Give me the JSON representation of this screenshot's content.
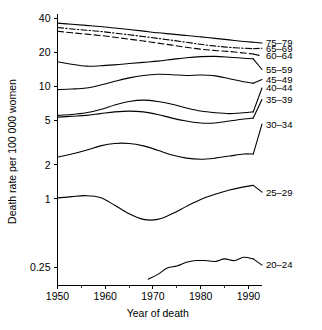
{
  "chart_data": {
    "type": "line",
    "title": "",
    "subtitle": "",
    "xlabel": "Year of death",
    "ylabel": "Death rate per 100 000 women",
    "xlim": [
      1950,
      1992
    ],
    "ylim": [
      0.2,
      45
    ],
    "yscale": "log",
    "xscale": "linear",
    "grid": false,
    "legend_position": "right-inline-labels",
    "x_ticks": [
      1950,
      1960,
      1970,
      1980,
      1990
    ],
    "x_tick_labels": [
      "1950",
      "1960",
      "1970",
      "1980",
      "1990"
    ],
    "x_minor_ticks": [
      1955,
      1965,
      1975,
      1985
    ],
    "y_ticks": [
      0.25,
      1,
      2,
      5,
      10,
      20,
      40
    ],
    "y_tick_labels": [
      "0.25",
      "1",
      "2",
      "5",
      "10",
      "20",
      "40"
    ],
    "series": [
      {
        "name": "75-79",
        "label": "75–79",
        "style": "solid",
        "label_y_value": 24.0,
        "x": [
          1950,
          1953,
          1956,
          1959,
          1962,
          1965,
          1968,
          1971,
          1974,
          1977,
          1980,
          1983,
          1986,
          1989,
          1991
        ],
        "values": [
          36.0,
          35.2,
          34.4,
          33.6,
          32.6,
          31.6,
          30.6,
          29.6,
          28.8,
          28.0,
          27.2,
          26.4,
          25.6,
          24.8,
          24.4
        ]
      },
      {
        "name": "65-69",
        "label": "65–69",
        "style": "dashdot",
        "label_y_value": 21.6,
        "x": [
          1950,
          1953,
          1956,
          1959,
          1962,
          1965,
          1968,
          1971,
          1974,
          1977,
          1980,
          1983,
          1986,
          1989,
          1991
        ],
        "values": [
          33.0,
          32.0,
          31.2,
          30.4,
          29.4,
          28.4,
          27.4,
          26.4,
          25.4,
          24.4,
          23.4,
          22.6,
          22.0,
          21.6,
          21.4
        ]
      },
      {
        "name": "60-64",
        "label": "60–64",
        "style": "dashed",
        "label_y_value": 18.4,
        "x": [
          1950,
          1953,
          1956,
          1959,
          1962,
          1965,
          1968,
          1971,
          1974,
          1977,
          1980,
          1983,
          1986,
          1989,
          1991
        ],
        "values": [
          30.5,
          29.6,
          28.8,
          28.0,
          27.0,
          26.0,
          25.0,
          24.0,
          23.0,
          22.0,
          21.2,
          20.6,
          20.2,
          19.6,
          19.2
        ]
      },
      {
        "name": "55-59",
        "label": "55–59",
        "style": "solid",
        "label_y_value": 14.0,
        "x": [
          1950,
          1953,
          1956,
          1959,
          1962,
          1965,
          1968,
          1971,
          1974,
          1977,
          1980,
          1983,
          1986,
          1989,
          1991
        ],
        "values": [
          16.4,
          15.6,
          15.0,
          15.1,
          15.4,
          15.8,
          16.2,
          16.6,
          17.2,
          17.8,
          18.2,
          18.3,
          18.0,
          17.6,
          17.4
        ]
      },
      {
        "name": "45-49",
        "label": "45–49",
        "style": "solid",
        "label_y_value": 11.4,
        "x": [
          1950,
          1953,
          1956,
          1959,
          1962,
          1965,
          1968,
          1971,
          1974,
          1977,
          1980,
          1983,
          1986,
          1989,
          1991
        ],
        "values": [
          9.3,
          9.4,
          9.6,
          10.2,
          11.0,
          11.8,
          12.4,
          12.7,
          12.6,
          12.4,
          12.5,
          12.3,
          11.6,
          10.9,
          10.6
        ]
      },
      {
        "name": "40-44",
        "label": "40–44",
        "style": "solid",
        "label_y_value": 9.6,
        "x": [
          1950,
          1953,
          1956,
          1959,
          1962,
          1965,
          1968,
          1971,
          1974,
          1977,
          1980,
          1983,
          1986,
          1989,
          1991
        ],
        "values": [
          5.5,
          5.6,
          5.8,
          6.2,
          6.8,
          7.3,
          7.5,
          7.3,
          6.9,
          6.4,
          6.0,
          5.8,
          5.7,
          5.8,
          5.9
        ]
      },
      {
        "name": "35-39",
        "label": "35–39",
        "style": "solid",
        "label_y_value": 7.6,
        "x": [
          1950,
          1953,
          1956,
          1959,
          1962,
          1965,
          1968,
          1971,
          1974,
          1977,
          1980,
          1983,
          1986,
          1989,
          1991
        ],
        "values": [
          5.3,
          5.4,
          5.5,
          5.7,
          5.9,
          6.0,
          5.9,
          5.6,
          5.2,
          4.9,
          4.7,
          4.7,
          4.9,
          5.1,
          5.2
        ]
      },
      {
        "name": "30-34",
        "label": "30–34",
        "style": "solid",
        "label_y_value": 4.6,
        "x": [
          1950,
          1953,
          1956,
          1959,
          1962,
          1965,
          1968,
          1971,
          1974,
          1977,
          1980,
          1983,
          1986,
          1989,
          1991
        ],
        "values": [
          2.35,
          2.5,
          2.7,
          2.95,
          3.1,
          3.1,
          2.95,
          2.7,
          2.45,
          2.3,
          2.25,
          2.3,
          2.4,
          2.5,
          2.5
        ]
      },
      {
        "name": "25-29",
        "label": "25–29",
        "style": "solid",
        "label_y_value": 1.15,
        "x": [
          1950,
          1953,
          1956,
          1959,
          1962,
          1965,
          1968,
          1971,
          1974,
          1977,
          1980,
          1983,
          1986,
          1989,
          1991
        ],
        "values": [
          1.02,
          1.05,
          1.07,
          1.03,
          0.88,
          0.74,
          0.66,
          0.66,
          0.74,
          0.86,
          0.99,
          1.1,
          1.2,
          1.28,
          1.32
        ]
      },
      {
        "name": "20-24",
        "label": "20–24",
        "style": "solid",
        "label_y_value": 0.26,
        "x": [
          1969,
          1971,
          1973,
          1975,
          1977,
          1979,
          1981,
          1983,
          1985,
          1987,
          1989,
          1991
        ],
        "values": [
          0.195,
          0.215,
          0.245,
          0.255,
          0.275,
          0.285,
          0.285,
          0.28,
          0.295,
          0.285,
          0.305,
          0.295
        ]
      }
    ]
  }
}
